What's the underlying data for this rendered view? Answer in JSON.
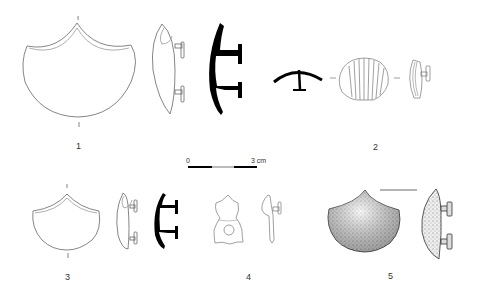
{
  "plate": {
    "figures": [
      {
        "number": "1",
        "description": "Large trefoil-pointed button, front view, side profile, and black section"
      },
      {
        "number": "2",
        "description": "Scallop-shell button, section, front view, and side profile"
      },
      {
        "number": "3",
        "description": "Smaller trefoil-pointed button, front view, side profile, and black section"
      },
      {
        "number": "4",
        "description": "Lobed pendant with central hole, front and side views"
      },
      {
        "number": "5",
        "description": "Stippled pointed button, front view and side profile"
      }
    ],
    "scale_bar": {
      "start_label": "0",
      "end_label": "3 cm"
    }
  },
  "colors": {
    "ink": "#222222",
    "line": "#555555",
    "section_fill": "#000000",
    "scale_grey": "#bbbbbb"
  }
}
